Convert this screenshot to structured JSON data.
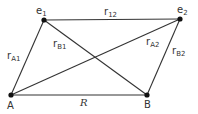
{
  "diagram": {
    "nodes": [
      {
        "id": "e1",
        "base": "e",
        "sub": "1",
        "x": 44,
        "y": 20
      },
      {
        "id": "e2",
        "base": "e",
        "sub": "2",
        "x": 180,
        "y": 19
      },
      {
        "id": "A",
        "base": "A",
        "sub": "",
        "x": 11,
        "y": 95
      },
      {
        "id": "B",
        "base": "B",
        "sub": "",
        "x": 147,
        "y": 95
      }
    ],
    "edges": [
      {
        "from": "e1",
        "to": "e2",
        "label_base": "r",
        "label_sub": "12"
      },
      {
        "from": "A",
        "to": "e1",
        "label_base": "r",
        "label_sub": "A1"
      },
      {
        "from": "B",
        "to": "e1",
        "label_base": "r",
        "label_sub": "B1"
      },
      {
        "from": "A",
        "to": "e2",
        "label_base": "r",
        "label_sub": "A2"
      },
      {
        "from": "B",
        "to": "e2",
        "label_base": "r",
        "label_sub": "B2"
      },
      {
        "from": "A",
        "to": "B",
        "label_base": "R",
        "label_sub": ""
      }
    ]
  }
}
